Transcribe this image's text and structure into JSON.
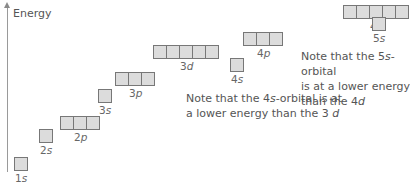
{
  "diagram": {
    "axis_label": "Energy",
    "orbitals": [
      {
        "name": "1s",
        "n": "1",
        "l": "s",
        "boxes": 1,
        "x": 14,
        "y": 157
      },
      {
        "name": "2s",
        "n": "2",
        "l": "s",
        "boxes": 1,
        "x": 39,
        "y": 129
      },
      {
        "name": "2p",
        "n": "2",
        "l": "p",
        "boxes": 3,
        "x": 60,
        "y": 116
      },
      {
        "name": "3s",
        "n": "3",
        "l": "s",
        "boxes": 1,
        "x": 98,
        "y": 89
      },
      {
        "name": "3p",
        "n": "3",
        "l": "p",
        "boxes": 3,
        "x": 115,
        "y": 72
      },
      {
        "name": "3d",
        "n": "3",
        "l": "d",
        "boxes": 5,
        "x": 153,
        "y": 45
      },
      {
        "name": "4s",
        "n": "4",
        "l": "s",
        "boxes": 1,
        "x": 230,
        "y": 58
      },
      {
        "name": "4p",
        "n": "4",
        "l": "p",
        "boxes": 3,
        "x": 243,
        "y": 32
      },
      {
        "name": "4d",
        "n": "4",
        "l": "d",
        "boxes": 5,
        "x": 343,
        "y": 5
      },
      {
        "name": "5s",
        "n": "5",
        "l": "s",
        "boxes": 1,
        "x": 372,
        "y": 17
      }
    ],
    "notes": [
      {
        "line1_pre": "Note that the 4",
        "line1_ital": "s",
        "line1_post": "-orbital is at",
        "line2_pre": "a lower energy than the 3 ",
        "line2_ital": "d"
      },
      {
        "line1_pre": "Note that the 5",
        "line1_ital": "s",
        "line1_post": "-orbital",
        "line2_pre": "is at a lower energy",
        "line3_pre": "than the 4",
        "line3_ital": "d"
      }
    ],
    "colors": {
      "box_fill": "#dcdcdc",
      "box_border": "#777777",
      "axis": "#9a9a9a"
    }
  }
}
